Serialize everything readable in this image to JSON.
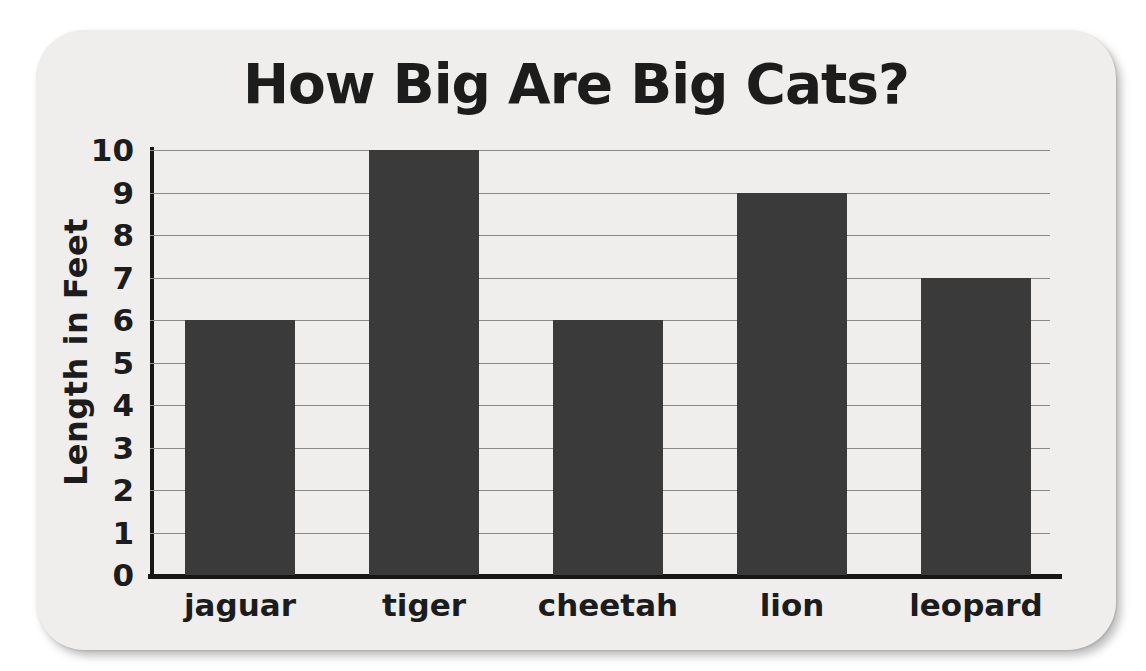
{
  "chart_data": {
    "type": "bar",
    "title": "How Big Are Big Cats?",
    "ylabel": "Length in Feet",
    "xlabel": "",
    "categories": [
      "jaguar",
      "tiger",
      "cheetah",
      "lion",
      "leopard"
    ],
    "values": [
      6,
      10,
      6,
      9,
      7
    ],
    "ylim": [
      0,
      10
    ],
    "yticks": [
      0,
      1,
      2,
      3,
      4,
      5,
      6,
      7,
      8,
      9,
      10
    ],
    "grid": "horizontal",
    "legend": "none",
    "colors": {
      "bar": "#3a3a3a",
      "axis": "#161616",
      "gridline": "#8a8a8a",
      "text": "#1c1c1c",
      "card_background": "#efeeec",
      "page_background": "#ffffff"
    }
  }
}
